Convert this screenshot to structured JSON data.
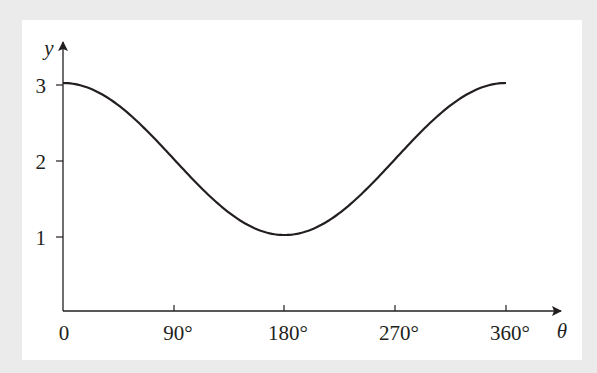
{
  "chart_data": {
    "type": "line",
    "title": "",
    "xlabel": "θ",
    "ylabel": "y",
    "function": "y = 2 + cos θ",
    "x_ticks": [
      "0",
      "90°",
      "180°",
      "270°",
      "360°"
    ],
    "x_tick_values": [
      0,
      90,
      180,
      270,
      360
    ],
    "y_ticks": [
      "1",
      "2",
      "3"
    ],
    "y_tick_values": [
      1,
      2,
      3
    ],
    "xlim": [
      0,
      360
    ],
    "ylim": [
      0,
      3.6
    ],
    "grid": false,
    "legend": null,
    "series": [
      {
        "name": "curve",
        "x": [
          0,
          30,
          60,
          90,
          120,
          150,
          180,
          210,
          240,
          270,
          300,
          330,
          360
        ],
        "values": [
          3,
          2.87,
          2.5,
          2,
          1.5,
          1.13,
          1,
          1.13,
          1.5,
          2,
          2.5,
          2.87,
          3
        ]
      }
    ]
  },
  "axes": {
    "x_label": "θ",
    "y_label": "y",
    "x_tick_labels": [
      "0",
      "90°",
      "180°",
      "270°",
      "360°"
    ],
    "y_tick_labels": [
      "1",
      "2",
      "3"
    ]
  },
  "colors": {
    "ink": "#231f20",
    "panel": "#ffffff",
    "background": "#ebebeb"
  }
}
